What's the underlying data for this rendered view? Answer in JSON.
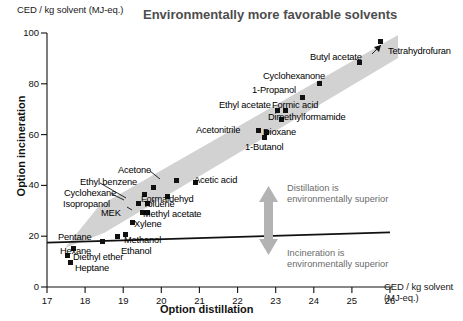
{
  "chart_data": {
    "type": "scatter",
    "title": "Environmentally more favorable solvents",
    "ylabel": "Option incineration",
    "xlabel": "Option distillation",
    "y_unit_label": "CED / kg solvent (MJ-eq.)",
    "x_unit_label_line1": "CED / kg solvent",
    "x_unit_label_line2": "(MJ-eq.)",
    "xlim": [
      17,
      26
    ],
    "ylim": [
      0,
      100
    ],
    "xticks": [
      17,
      18,
      19,
      20,
      21,
      22,
      23,
      24,
      25,
      26
    ],
    "yticks": [
      0,
      20,
      40,
      60,
      80,
      100
    ],
    "grid": false,
    "legend": "none",
    "points": [
      {
        "name": "Heptane",
        "x": 17.62,
        "y": 9.5,
        "lx": 75,
        "ly": 263,
        "anchor": "left"
      },
      {
        "name": "Diethyl ether",
        "x": 17.55,
        "y": 12.5,
        "lx": 73,
        "ly": 252,
        "anchor": "left"
      },
      {
        "name": "Hexane",
        "x": 17.7,
        "y": 15.0,
        "lx": 60,
        "ly": 246,
        "anchor": "left"
      },
      {
        "name": "Pentane",
        "x": 18.45,
        "y": 18.0,
        "lx": 58,
        "ly": 232,
        "anchor": "left"
      },
      {
        "name": "Ethanol",
        "x": 19.05,
        "y": 20.5,
        "lx": 121,
        "ly": 246,
        "anchor": "left"
      },
      {
        "name": "Methanol",
        "x": 18.85,
        "y": 20.0,
        "lx": 124,
        "ly": 235,
        "anchor": "left"
      },
      {
        "name": "Xylene",
        "x": 19.25,
        "y": 25.5,
        "lx": 134,
        "ly": 219,
        "anchor": "left"
      },
      {
        "name": "MEK",
        "x": 19.5,
        "y": 29.5,
        "lx": 101,
        "ly": 208,
        "anchor": "left"
      },
      {
        "name": "Methyl acetate",
        "x": 19.65,
        "y": 29.5,
        "lx": 143,
        "ly": 209,
        "anchor": "left"
      },
      {
        "name": "Isopropanol",
        "x": 19.4,
        "y": 33.0,
        "lx": 63,
        "ly": 199,
        "anchor": "left"
      },
      {
        "name": "Toluene",
        "x": 19.65,
        "y": 33.0,
        "lx": 143,
        "ly": 199,
        "anchor": "left"
      },
      {
        "name": "Cyclohexane",
        "x": 19.55,
        "y": 36.5,
        "lx": 64,
        "ly": 188,
        "anchor": "left"
      },
      {
        "name": "Formaldehyd",
        "x": 20.15,
        "y": 35.5,
        "lx": 141,
        "ly": 194,
        "anchor": "left"
      },
      {
        "name": "Ethyl benzene",
        "x": 19.8,
        "y": 39.0,
        "lx": 80,
        "ly": 177,
        "anchor": "left"
      },
      {
        "name": "Acetone",
        "x": 20.4,
        "y": 42.0,
        "lx": 118,
        "ly": 165,
        "anchor": "left"
      },
      {
        "name": "Acetic acid",
        "x": 20.9,
        "y": 41.0,
        "lx": 194,
        "ly": 175,
        "anchor": "left"
      },
      {
        "name": "1-Butanol",
        "x": 22.7,
        "y": 59.0,
        "lx": 245,
        "ly": 142,
        "anchor": "left"
      },
      {
        "name": "Dioxane",
        "x": 22.75,
        "y": 61.0,
        "lx": 263,
        "ly": 127,
        "anchor": "left"
      },
      {
        "name": "Acetonitrile",
        "x": 22.55,
        "y": 61.5,
        "lx": 196,
        "ly": 125,
        "anchor": "left"
      },
      {
        "name": "Dimethylformamide",
        "x": 23.15,
        "y": 66.0,
        "lx": 268,
        "ly": 112,
        "anchor": "left"
      },
      {
        "name": "Ethyl acetate",
        "x": 23.05,
        "y": 69.5,
        "lx": 219,
        "ly": 100,
        "anchor": "left"
      },
      {
        "name": "Formic acid",
        "x": 23.25,
        "y": 69.5,
        "lx": 272,
        "ly": 100,
        "anchor": "left"
      },
      {
        "name": "1-Propanol",
        "x": 23.7,
        "y": 74.5,
        "lx": 252,
        "ly": 85,
        "anchor": "left"
      },
      {
        "name": "Cyclohexanone",
        "x": 24.15,
        "y": 80.0,
        "lx": 263,
        "ly": 71,
        "anchor": "left"
      },
      {
        "name": "Butyl acetate",
        "x": 25.2,
        "y": 88.5,
        "lx": 310,
        "ly": 52,
        "anchor": "left"
      },
      {
        "name": "Tetrahydrofuran",
        "x": 25.75,
        "y": 96.5,
        "lx": 388,
        "ly": 46,
        "anchor": "left"
      }
    ],
    "annotations": [
      {
        "id": "distillation-superior",
        "line1": "Distillation is",
        "line2": "environmentally superior"
      },
      {
        "id": "incineration-superior",
        "line1": "Incineration is",
        "line2": "environmentally superior"
      }
    ],
    "trend_line": {
      "x0": 17.0,
      "y0": 17.5,
      "x1": 26.0,
      "y1": 21.5
    },
    "band": {
      "from": [
        18.3,
        15.0
      ],
      "to": [
        25.9,
        97.0
      ],
      "color": "#d0d0d0"
    },
    "arrow_color": "#b3b3b3",
    "marker_color": "#111111",
    "title_color": "#4d4d4d",
    "annotation_color": "#6b6b6b"
  }
}
